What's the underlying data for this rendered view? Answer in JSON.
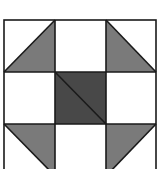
{
  "diagram": {
    "grid": {
      "x": [
        4,
        55,
        106,
        156
      ],
      "y": [
        20,
        72,
        124,
        176
      ]
    },
    "colors": {
      "background": "#ffffff",
      "line": "#1a1a1a",
      "light_fill": "#ffffff",
      "medium_fill": "#7a7a7a",
      "dark_fill": "#484848"
    },
    "cells": [
      {
        "row": 0,
        "col": 0,
        "type": "half-triangle",
        "shaded": "bottom-right",
        "diagonal": "bottom-left-to-top-right"
      },
      {
        "row": 0,
        "col": 1,
        "type": "plain",
        "fill": "light"
      },
      {
        "row": 0,
        "col": 2,
        "type": "half-triangle",
        "shaded": "bottom-left",
        "diagonal": "top-left-to-bottom-right"
      },
      {
        "row": 1,
        "col": 0,
        "type": "plain",
        "fill": "light"
      },
      {
        "row": 1,
        "col": 1,
        "type": "center-square",
        "fill": "dark",
        "diagonal": "top-left-to-bottom-right"
      },
      {
        "row": 1,
        "col": 2,
        "type": "plain",
        "fill": "light"
      },
      {
        "row": 2,
        "col": 0,
        "type": "half-triangle",
        "shaded": "top-right",
        "diagonal": "top-left-to-bottom-right"
      },
      {
        "row": 2,
        "col": 1,
        "type": "plain",
        "fill": "light"
      },
      {
        "row": 2,
        "col": 2,
        "type": "half-triangle",
        "shaded": "top-left",
        "diagonal": "bottom-left-to-top-right"
      }
    ]
  }
}
